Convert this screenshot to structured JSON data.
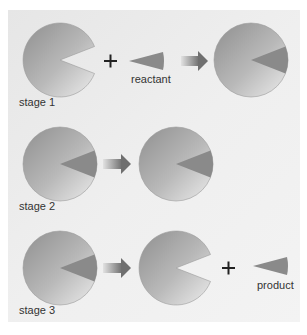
{
  "diagram": {
    "type": "enzyme-substrate reaction stages",
    "colors": {
      "background": "#ececec",
      "enzyme_dark": "#8f8f8f",
      "enzyme_light": "#e6e6e6",
      "wedge": "#8a8a8a",
      "arrow_dark": "#6f6f6f",
      "arrow_light": "#d8d8d8",
      "text": "#333333"
    },
    "stages": [
      {
        "label": "stage 1",
        "elements": [
          "enzyme-with-empty-site",
          "plus",
          "reactant",
          "arrow",
          "enzyme-with-bound-wedge"
        ],
        "reactant_label": "reactant"
      },
      {
        "label": "stage 2",
        "elements": [
          "enzyme-with-bound-wedge",
          "arrow",
          "enzyme-with-bound-wedge"
        ]
      },
      {
        "label": "stage 3",
        "elements": [
          "enzyme-with-bound-wedge",
          "arrow",
          "enzyme-with-empty-site",
          "plus",
          "product"
        ],
        "product_label": "product"
      }
    ],
    "plus_symbol": "+"
  }
}
